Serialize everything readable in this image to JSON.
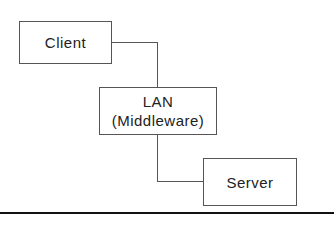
{
  "diagram": {
    "nodes": [
      {
        "id": "client",
        "label": "Client"
      },
      {
        "id": "lan",
        "label_line1": "LAN",
        "label_line2": "(Middleware)"
      },
      {
        "id": "server",
        "label": "Server"
      }
    ],
    "edges": [
      {
        "from": "client",
        "to": "lan"
      },
      {
        "from": "lan",
        "to": "server"
      }
    ],
    "colors": {
      "stroke": "#555555",
      "text": "#222222",
      "rule": "#111111"
    }
  }
}
